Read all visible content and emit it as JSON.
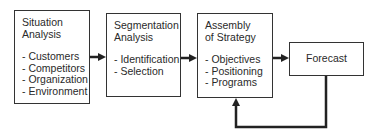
{
  "diagram": {
    "boxes": [
      {
        "id": "situation",
        "title_lines": [
          "Situation",
          "Analysis"
        ],
        "items": [
          "- Customers",
          "- Competitors",
          "- Organization",
          "- Environment"
        ]
      },
      {
        "id": "segmentation",
        "title_lines": [
          "Segmentation",
          "Analysis"
        ],
        "items": [
          "- Identification",
          "- Selection"
        ]
      },
      {
        "id": "strategy",
        "title_lines": [
          "Assembly",
          "of Strategy"
        ],
        "items": [
          "- Objectives",
          "- Positioning",
          "- Programs"
        ]
      },
      {
        "id": "forecast",
        "title_lines": [
          "Forecast"
        ],
        "items": []
      }
    ],
    "edges": [
      {
        "from": "situation",
        "to": "segmentation",
        "type": "arrow"
      },
      {
        "from": "segmentation",
        "to": "strategy",
        "type": "arrow"
      },
      {
        "from": "strategy",
        "to": "forecast",
        "type": "arrow"
      },
      {
        "from": "forecast",
        "to": "strategy",
        "type": "feedback-arrow"
      }
    ],
    "colors": {
      "line": "#222222",
      "text": "#2a2a2a",
      "background": "#ffffff"
    }
  }
}
